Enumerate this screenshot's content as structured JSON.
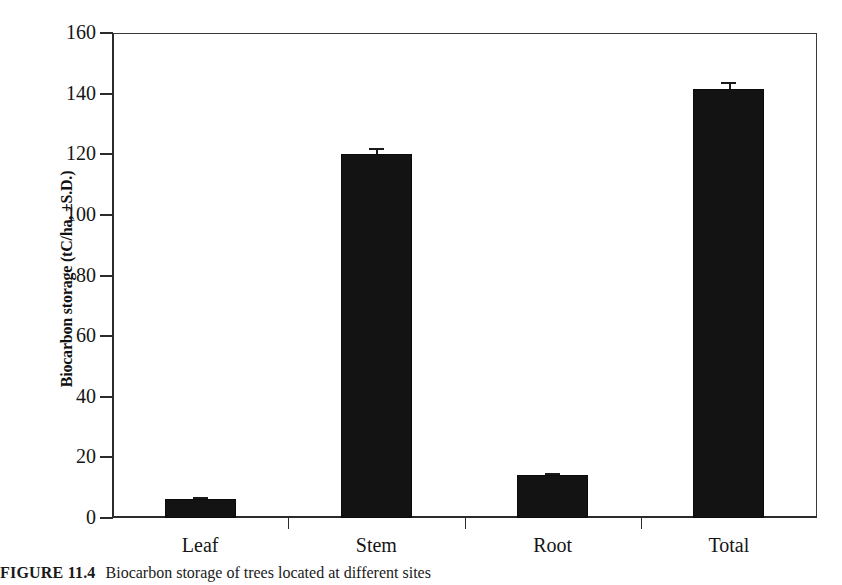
{
  "figure": {
    "caption_label": "FIGURE 11.4",
    "caption_text": "Biocarbon storage of trees located at different sites"
  },
  "chart_data": {
    "type": "bar",
    "title": "",
    "xlabel": "",
    "ylabel": "Biocarbon storage (tC/ha, ±S.D.)",
    "categories": [
      "Leaf",
      "Stem",
      "Root",
      "Total"
    ],
    "values": [
      6.3,
      120.0,
      14.2,
      141.5
    ],
    "errors": [
      0.6,
      2.0,
      0.7,
      2.3
    ],
    "ylim": [
      0,
      160
    ],
    "yticks": [
      0,
      20,
      40,
      60,
      80,
      100,
      120,
      140,
      160
    ],
    "ytick_labels": [
      "0",
      "20",
      "40",
      "60",
      "80",
      "100",
      "120",
      "140",
      "160"
    ],
    "grid": false,
    "legend": "none",
    "bar_color": "#131313",
    "error_color": "#1a1a1a",
    "axis_color": "#2b2b2b"
  }
}
